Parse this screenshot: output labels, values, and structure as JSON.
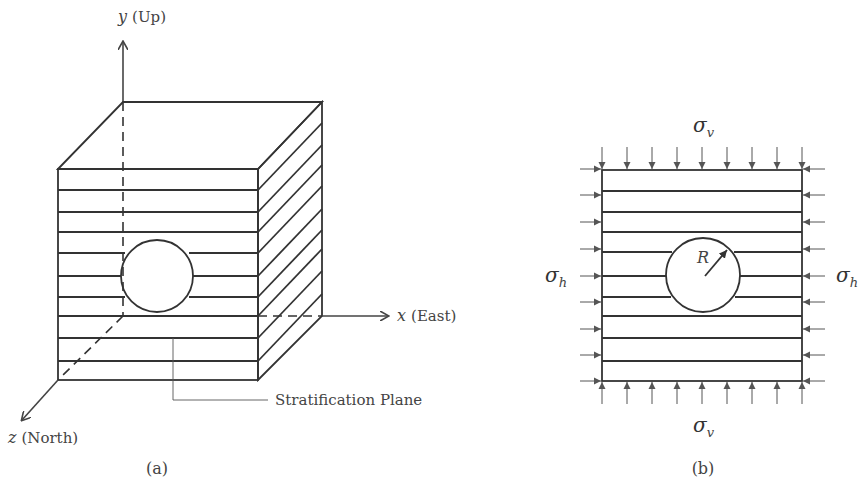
{
  "figure_a": {
    "caption": "(a)",
    "axes": {
      "y": {
        "var": "y",
        "label": "(Up)"
      },
      "x": {
        "var": "x",
        "label": "(East)"
      },
      "z": {
        "var": "z",
        "label": "(North)"
      }
    },
    "annotation": "Stratification Plane",
    "stratification_layers": 11,
    "features": [
      "cube",
      "circular-opening",
      "layered-strata"
    ]
  },
  "figure_b": {
    "caption": "(b)",
    "stress_vertical": {
      "symbol": "σ",
      "subscript": "v"
    },
    "stress_horizontal": {
      "symbol": "σ",
      "subscript": "h"
    },
    "radius_label": "R",
    "stratification_layers": 11,
    "arrows_per_side": 9
  },
  "colors": {
    "line": "#333333",
    "text": "#444444",
    "background": "#ffffff"
  }
}
